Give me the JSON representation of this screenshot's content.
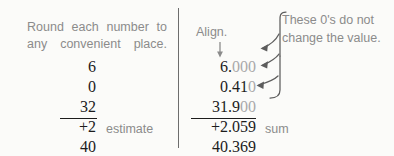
{
  "figure": {
    "background_color": "#fbfbf9",
    "ink_color": "#1c1c1c",
    "annotation_color": "#8b8b8b",
    "faded_zero_color": "#a9a9a9"
  },
  "left_panel": {
    "instruction_line1": "Round each number to",
    "instruction_line2": "any convenient place.",
    "addends": [
      "6",
      "0",
      "32",
      "+2"
    ],
    "result": "40",
    "result_label": "estimate"
  },
  "right_panel": {
    "align_label": "Align.",
    "align_arrow_icon": "down-arrow-icon",
    "note_line1": "These 0's do not",
    "note_line2": "change the value.",
    "brace_icon": "curly-brace-icon",
    "rows": [
      {
        "significant": "6.",
        "trailing_zeros": "000",
        "has_arrow": true
      },
      {
        "significant": "0.41",
        "trailing_zeros": "0",
        "has_arrow": true
      },
      {
        "significant": "31.9",
        "trailing_zeros": "00",
        "has_arrow": true
      },
      {
        "significant": "+2.059",
        "trailing_zeros": "",
        "has_arrow": false
      }
    ],
    "result": "40.369",
    "result_label": "sum"
  }
}
